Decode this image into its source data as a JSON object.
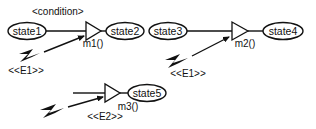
{
  "diagram": {
    "transitions": [
      {
        "id": "t1",
        "source": "state1",
        "target": "state2",
        "guard": "<condition>",
        "method": "m1()",
        "event": "<<E1>>"
      },
      {
        "id": "t2",
        "source": "state3",
        "target": "state4",
        "method": "m2()",
        "event": "<<E1>>"
      },
      {
        "id": "t3",
        "source": null,
        "target": "state5",
        "method": "m3()",
        "event": "<<E2>>"
      }
    ],
    "states": {
      "state1": "state1",
      "state2": "state2",
      "state3": "state3",
      "state4": "state4",
      "state5": "state5"
    },
    "labels": {
      "condition": "<condition>",
      "m1": "m1()",
      "m2": "m2()",
      "m3": "m3()",
      "e1_a": "<<E1>>",
      "e1_b": "<<E1>>",
      "e2": "<<E2>>"
    },
    "icons": {
      "event_icon": "lightning-bolt-icon",
      "method_icon": "triangle-icon"
    },
    "colors": {
      "stroke": "#111111",
      "background": "#ffffff"
    }
  }
}
